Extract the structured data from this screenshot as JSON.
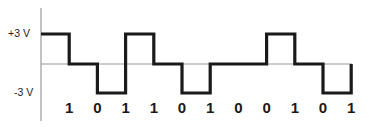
{
  "diagram": {
    "type": "line-coding-waveform",
    "levels": {
      "high_label": "+3 V",
      "low_label": "-3 V"
    },
    "bits": [
      "1",
      "0",
      "1",
      "1",
      "0",
      "1",
      "0",
      "0",
      "1",
      "0",
      "1"
    ],
    "waveform_levels": [
      3,
      0,
      -3,
      3,
      0,
      -3,
      0,
      0,
      3,
      0,
      -3
    ],
    "colors": {
      "signal": "#1a1a1a",
      "baseline": "#999999",
      "axis": "#888888"
    }
  }
}
